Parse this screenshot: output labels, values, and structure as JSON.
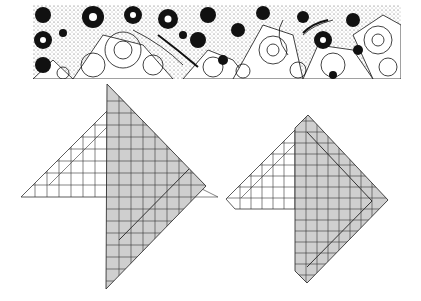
{
  "banner": {
    "description": "floral pattern strip",
    "colors": {
      "ink": "#111111",
      "paper": "#ffffff",
      "stipple": "#9a9a9a"
    }
  },
  "diagrams": [
    {
      "id": "left",
      "description": "square-grid folding diagram, shaded right portion with a white triangular flap on the left",
      "shaded_fill": "#cfcfcf",
      "line_color": "#333333"
    },
    {
      "id": "right",
      "description": "square-grid folding diagram, shaded right portion with a white trapezoidal flap on the left",
      "shaded_fill": "#cfcfcf",
      "line_color": "#333333"
    }
  ]
}
